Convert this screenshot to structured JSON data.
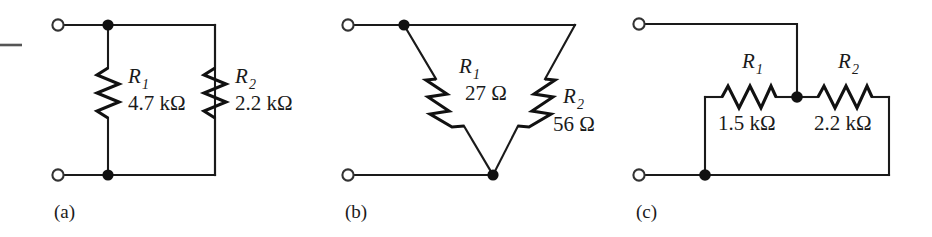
{
  "figure": {
    "ink_color": "#1a1a1a",
    "background": "#ffffff"
  },
  "circuits": [
    {
      "caption": "(a)",
      "topology": "parallel",
      "resistors": [
        {
          "designator": "R",
          "subscript": "1",
          "value": "4.7 kΩ"
        },
        {
          "designator": "R",
          "subscript": "2",
          "value": "2.2 kΩ"
        }
      ]
    },
    {
      "caption": "(b)",
      "topology": "delta-vee",
      "resistors": [
        {
          "designator": "R",
          "subscript": "1",
          "value": "27 Ω"
        },
        {
          "designator": "R",
          "subscript": "2",
          "value": "56 Ω"
        }
      ]
    },
    {
      "caption": "(c)",
      "topology": "series-loop-with-tap",
      "resistors": [
        {
          "designator": "R",
          "subscript": "1",
          "value": "1.5 kΩ"
        },
        {
          "designator": "R",
          "subscript": "2",
          "value": "2.2 kΩ"
        }
      ]
    }
  ]
}
